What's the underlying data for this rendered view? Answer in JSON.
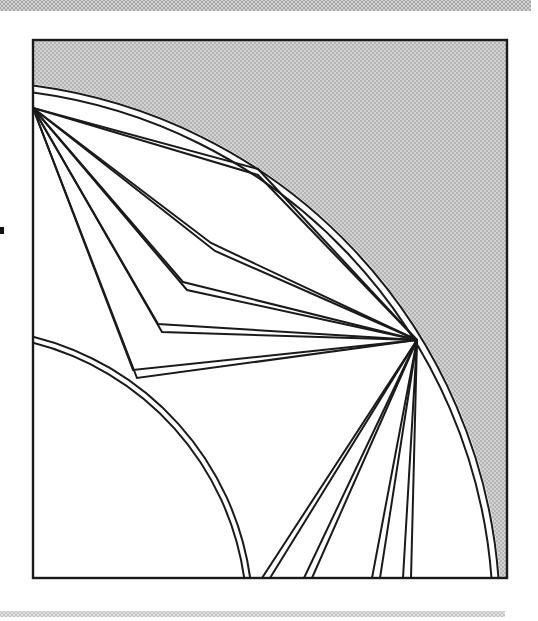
{
  "figure": {
    "colors": {
      "line": "#1a1a1a",
      "paper": "#ffffff",
      "halftone_dot": "#a6a6a6",
      "halftone_bg": "#d2d2d2"
    },
    "canvas": {
      "w": 538,
      "h": 621
    },
    "frame": {
      "x": 33,
      "y": 40,
      "w": 474,
      "h": 538
    },
    "circle_center": {
      "x": -37,
      "y": 618
    },
    "white_disc_radius": 538.5,
    "outer_arc_radii": [
      537,
      530
    ],
    "inner_arc_radii": [
      290,
      284
    ],
    "point_a": {
      "x": 33,
      "y": 108
    },
    "point_b": {
      "x": 417,
      "y": 340
    },
    "bent_paths": [
      {
        "vx": 258,
        "vy": 172,
        "ox": 0,
        "oy": 3
      },
      {
        "vx": 213,
        "vy": 247,
        "ox": 2,
        "oy": 4
      },
      {
        "vx": 185,
        "vy": 286,
        "ox": 2,
        "oy": 4
      },
      {
        "vx": 160,
        "vy": 328,
        "ox": 2,
        "oy": 4
      },
      {
        "vx": 135,
        "vy": 374,
        "ox": 2,
        "oy": 4
      }
    ],
    "bottom_rays_x": [
      262,
      270,
      304,
      312,
      372,
      380,
      403,
      411
    ],
    "bottom_y": 578,
    "stroke_width": 2,
    "frame_stroke_width": 2.4,
    "top_bar": {
      "x": 0,
      "y": 0,
      "w": 531,
      "h": 11
    },
    "footer_bar": {
      "x": 0,
      "y": 611,
      "w": 505,
      "h": 6
    },
    "left_tick": {
      "x": 0,
      "y": 227,
      "w": 4,
      "h": 7
    }
  }
}
